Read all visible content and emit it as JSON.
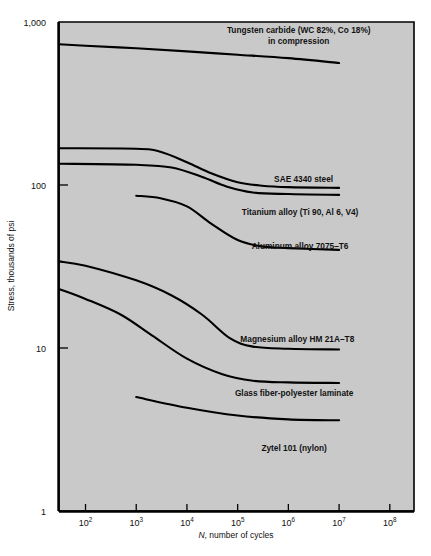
{
  "chart_data": {
    "type": "line",
    "title": "",
    "xlabel": "N, number of cycles",
    "ylabel": "Stress, thousands of psi",
    "xscale": "log",
    "yscale": "log",
    "xlim": [
      30,
      300000000
    ],
    "ylim": [
      1,
      1000
    ],
    "grid": false,
    "legend_position": "inline-annotations",
    "plot_bg": "#c9c9c9",
    "line_color": "#000000",
    "x_tick_labels": [
      "102",
      "103",
      "104",
      "105",
      "106",
      "107",
      "108"
    ],
    "x_tick_values": [
      100,
      1000,
      10000,
      100000,
      1000000,
      10000000,
      100000000
    ],
    "x_tick_mantissa": [
      "10",
      "10",
      "10",
      "10",
      "10",
      "10",
      "10"
    ],
    "x_tick_exponent": [
      "2",
      "3",
      "4",
      "5",
      "6",
      "7",
      "8"
    ],
    "y_tick_labels": [
      "1,000",
      "100",
      "10",
      "1"
    ],
    "y_tick_values": [
      1000,
      100,
      10,
      1
    ],
    "series": [
      {
        "name": "Tungsten carbide (WC 82%, Co 18%) in compression",
        "label_lines": [
          "Tungsten carbide (WC 82%, Co 18%)",
          "in compression"
        ],
        "label_x": 1600000,
        "label_y_px": 33,
        "points": [
          [
            30,
            730
          ],
          [
            100,
            715
          ],
          [
            1000,
            690
          ],
          [
            10000,
            660
          ],
          [
            100000,
            630
          ],
          [
            1000000,
            600
          ],
          [
            10000000,
            560
          ]
        ]
      },
      {
        "name": "SAE 4340 steel",
        "label_lines": [
          "SAE 4340 steel"
        ],
        "label_x": 2000000,
        "label_y_px": 182,
        "points": [
          [
            30,
            168
          ],
          [
            1000,
            167
          ],
          [
            3000,
            160
          ],
          [
            10000,
            138
          ],
          [
            30000,
            118
          ],
          [
            100000,
            104
          ],
          [
            300000,
            99
          ],
          [
            1000000,
            97
          ],
          [
            10000000,
            96
          ]
        ]
      },
      {
        "name": "Titanium alloy (Ti 90, Al 6, V4)",
        "label_lines": [
          "Titanium alloy (Ti 90, Al 6, V4)"
        ],
        "label_x": 1700000,
        "label_y_px": 215,
        "points": [
          [
            30,
            135
          ],
          [
            1000,
            133
          ],
          [
            5000,
            128
          ],
          [
            20000,
            112
          ],
          [
            60000,
            98
          ],
          [
            200000,
            90
          ],
          [
            1000000,
            88
          ],
          [
            10000000,
            87
          ]
        ]
      },
      {
        "name": "Aluminum alloy 7075-T6",
        "label_lines": [
          "Aluminum alloy 7075–T6"
        ],
        "label_x": 1700000,
        "label_y_px": 249,
        "points": [
          [
            1000,
            86
          ],
          [
            3000,
            83
          ],
          [
            10000,
            74
          ],
          [
            30000,
            58
          ],
          [
            100000,
            46
          ],
          [
            300000,
            42
          ],
          [
            1000000,
            41
          ],
          [
            10000000,
            40
          ]
        ]
      },
      {
        "name": "Magnesium alloy HM 21A-T8",
        "label_lines": [
          "Magnesium alloy HM 21A–T8"
        ],
        "label_x": 1500000,
        "label_y_px": 342,
        "points": [
          [
            30,
            34
          ],
          [
            100,
            32
          ],
          [
            1000,
            26
          ],
          [
            5000,
            21
          ],
          [
            20000,
            16
          ],
          [
            70000,
            11.5
          ],
          [
            200000,
            10.2
          ],
          [
            1000000,
            9.9
          ],
          [
            10000000,
            9.8
          ]
        ]
      },
      {
        "name": "Glass fiber-polyester laminate",
        "label_lines": [
          "Glass fiber-polyester laminate"
        ],
        "label_x": 1300000,
        "label_y_px": 396,
        "points": [
          [
            30,
            23
          ],
          [
            100,
            20
          ],
          [
            500,
            16
          ],
          [
            2000,
            12
          ],
          [
            10000,
            8.6
          ],
          [
            50000,
            6.9
          ],
          [
            200000,
            6.3
          ],
          [
            1000000,
            6.15
          ],
          [
            10000000,
            6.1
          ]
        ]
      },
      {
        "name": "Zytel 101 (nylon)",
        "label_lines": [
          "Zytel 101 (nylon)"
        ],
        "label_x": 1300000,
        "label_y_px": 451,
        "points": [
          [
            1000,
            5.0
          ],
          [
            10000,
            4.3
          ],
          [
            100000,
            3.85
          ],
          [
            1000000,
            3.65
          ],
          [
            10000000,
            3.6
          ]
        ]
      }
    ]
  },
  "geometry": {
    "plot_left_px": 59,
    "plot_right_px": 414,
    "plot_top_px": 22,
    "plot_bottom_px": 511,
    "decade_px": 163
  }
}
